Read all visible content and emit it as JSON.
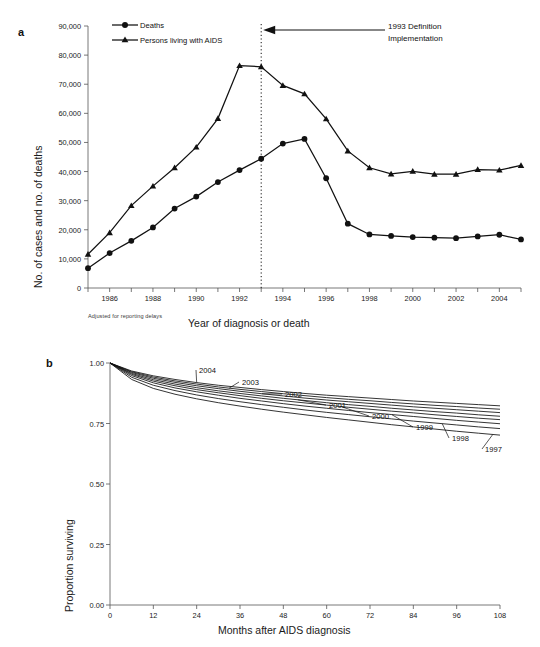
{
  "figure": {
    "panel_a_letter": "a",
    "panel_b_letter": "b"
  },
  "panel_a": {
    "y_axis_title": "No. of cases and no. of deaths",
    "x_axis_title": "Year of diagnosis or death",
    "footnote": "Adjusted for reporting delays",
    "annotation_line1": "1993 Definition",
    "annotation_line2": "Implementation",
    "annotation_year": 1993,
    "legend": [
      {
        "label": "Deaths",
        "marker": "circle-marker-icon"
      },
      {
        "label": "Persons living with  AIDS",
        "marker": "triangle-marker-icon"
      }
    ],
    "y_ticks": [
      "0",
      "10,000",
      "20,000",
      "30,000",
      "40,000",
      "50,000",
      "60,000",
      "70,000",
      "80,000",
      "90,000"
    ],
    "x_ticks": [
      "1986",
      "1988",
      "1990",
      "1992",
      "1994",
      "1996",
      "1998",
      "2000",
      "2002",
      "2004"
    ]
  },
  "panel_b": {
    "y_axis_title": "Proportion surviving",
    "x_axis_title": "Months after AIDS diagnosis",
    "y_ticks": [
      "0.00",
      "0.25",
      "0.50",
      "0.75",
      "1.00"
    ],
    "x_ticks": [
      "0",
      "12",
      "24",
      "36",
      "48",
      "60",
      "72",
      "84",
      "96",
      "108"
    ],
    "curve_labels": [
      "2004",
      "2003",
      "2002",
      "2001",
      "2000",
      "1999",
      "1998",
      "1997"
    ]
  },
  "chart_data": [
    {
      "type": "line",
      "id": "panel-a",
      "title": "",
      "xlabel": "Year of diagnosis or death",
      "ylabel": "No. of cases and no. of deaths",
      "xlim": [
        1985,
        2005
      ],
      "ylim": [
        0,
        90000
      ],
      "ytick_step": 10000,
      "xtick_step": 1,
      "xtick_label_step": 2,
      "grid": false,
      "legend_position": "top-left",
      "x": [
        1985,
        1986,
        1987,
        1988,
        1989,
        1990,
        1991,
        1992,
        1993,
        1994,
        1995,
        1996,
        1997,
        1998,
        1999,
        2000,
        2001,
        2002,
        2003,
        2004,
        2005
      ],
      "series": [
        {
          "name": "Deaths",
          "marker": "circle",
          "values": [
            6800,
            12000,
            16200,
            20800,
            27300,
            31400,
            36400,
            40500,
            44400,
            49600,
            51200,
            37700,
            22100,
            18400,
            17900,
            17500,
            17300,
            17100,
            17700,
            18300,
            16700
          ]
        },
        {
          "name": "Persons living with  AIDS",
          "marker": "triangle",
          "values": [
            11600,
            19000,
            28300,
            35000,
            41300,
            48400,
            58200,
            76400,
            76000,
            69600,
            66700,
            58100,
            47100,
            41300,
            39200,
            40100,
            39100,
            39100,
            40700,
            40500,
            42100
          ]
        }
      ],
      "annotations": [
        {
          "text": "1993 Definition Implementation",
          "x": 1993,
          "type": "vertical-dotted-line-with-arrow"
        }
      ],
      "footnote": "Adjusted for reporting delays"
    },
    {
      "type": "line",
      "id": "panel-b",
      "title": "",
      "xlabel": "Months after AIDS diagnosis",
      "ylabel": "Proportion surviving",
      "xlim": [
        0,
        108
      ],
      "ylim": [
        0,
        1
      ],
      "ytick_step": 0.25,
      "xtick_step": 12,
      "grid": false,
      "legend_position": "inline-curve-labels",
      "x": [
        0,
        6,
        12,
        18,
        24,
        30,
        36,
        42,
        48,
        54,
        60,
        66,
        72,
        78,
        84,
        90,
        96,
        102,
        108
      ],
      "series": [
        {
          "name": "1997",
          "values": [
            1.0,
            0.932,
            0.895,
            0.871,
            0.852,
            0.836,
            0.822,
            0.809,
            0.797,
            0.786,
            0.775,
            0.765,
            0.755,
            0.745,
            0.736,
            0.727,
            0.718,
            0.71,
            0.702
          ]
        },
        {
          "name": "1998",
          "values": [
            1.0,
            0.941,
            0.908,
            0.886,
            0.868,
            0.853,
            0.84,
            0.828,
            0.817,
            0.806,
            0.796,
            0.787,
            0.778,
            0.769,
            0.76,
            0.752,
            0.744,
            0.736,
            0.729
          ]
        },
        {
          "name": "1999",
          "values": [
            1.0,
            0.948,
            0.918,
            0.897,
            0.881,
            0.867,
            0.854,
            0.843,
            0.832,
            0.822,
            0.813,
            0.804,
            0.795,
            0.787,
            0.779,
            0.771,
            0.763,
            0.756,
            0.749
          ]
        },
        {
          "name": "2000",
          "values": [
            1.0,
            0.953,
            0.925,
            0.906,
            0.89,
            0.877,
            0.865,
            0.854,
            0.844,
            0.835,
            0.826,
            0.817,
            0.809,
            0.801,
            0.794,
            0.786,
            0.779,
            0.772,
            0.766
          ]
        },
        {
          "name": "2001",
          "values": [
            1.0,
            0.957,
            0.931,
            0.913,
            0.898,
            0.885,
            0.874,
            0.864,
            0.854,
            0.845,
            0.836,
            0.828,
            0.821,
            0.813,
            0.806,
            0.799,
            0.793,
            0.786,
            0.78
          ]
        },
        {
          "name": "2002",
          "values": [
            1.0,
            0.961,
            0.937,
            0.92,
            0.906,
            0.894,
            0.883,
            0.873,
            0.864,
            0.855,
            0.847,
            0.84,
            0.833,
            0.826,
            0.819,
            0.813,
            0.807,
            0.801,
            0.795
          ]
        },
        {
          "name": "2003",
          "values": [
            1.0,
            0.964,
            0.942,
            0.926,
            0.913,
            0.901,
            0.891,
            0.882,
            0.873,
            0.865,
            0.857,
            0.85,
            0.844,
            0.837,
            0.831,
            0.825,
            0.82,
            0.814,
            0.809
          ]
        },
        {
          "name": "2004",
          "values": [
            1.0,
            0.967,
            0.947,
            0.932,
            0.919,
            0.908,
            0.899,
            0.89,
            0.882,
            0.874,
            0.867,
            0.861,
            0.855,
            0.849,
            0.843,
            0.838,
            0.833,
            0.828,
            0.823
          ]
        }
      ]
    }
  ]
}
